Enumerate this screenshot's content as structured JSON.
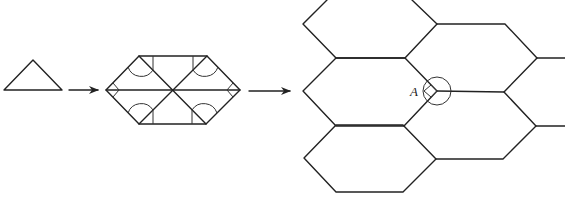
{
  "diagram": {
    "stages": [
      {
        "name": "triangle",
        "label": ""
      },
      {
        "name": "hexagon-from-triangles",
        "label": ""
      },
      {
        "name": "hexagon-tiling",
        "label": ""
      }
    ],
    "point_label": "A",
    "stroke_color": "#222222",
    "background_color": "#ffffff"
  }
}
